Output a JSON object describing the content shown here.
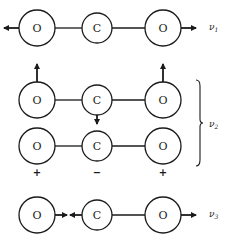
{
  "diagram": {
    "atoms": {
      "oxygen": "O",
      "carbon": "C"
    },
    "modes": [
      {
        "id": "v1",
        "label": "ν",
        "subscript": "1",
        "description": "symmetric stretch: O atoms move outward, C stationary"
      },
      {
        "id": "v2",
        "label": "ν",
        "subscript": "2",
        "description": "bending (degenerate): O atoms up, C down; O +, C −, O + out of plane"
      },
      {
        "id": "v3",
        "label": "ν",
        "subscript": "3",
        "description": "asymmetric stretch: O atoms move right, C moves left"
      }
    ],
    "signs": {
      "left": "+",
      "center": "−",
      "right": "+"
    }
  }
}
